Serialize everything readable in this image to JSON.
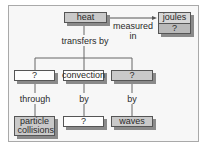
{
  "diagram": {
    "type": "concept-map",
    "nodes": {
      "heat": "heat",
      "joules_top": "joules",
      "joules_bottom": "?",
      "branch_left": "?",
      "branch_mid": "convection",
      "branch_right": "?",
      "leaf_left": "particle collisions",
      "leaf_mid": "?",
      "leaf_right": "waves"
    },
    "links": {
      "measured_in": "measured in",
      "transfers_by": "transfers by",
      "through": "through",
      "by_mid": "by",
      "by_right": "by"
    },
    "colors": {
      "gray_box": "#c9c9c9",
      "white_box": "#fdfdfd",
      "border": "#555555",
      "shadow": "#8a8a8a"
    }
  }
}
